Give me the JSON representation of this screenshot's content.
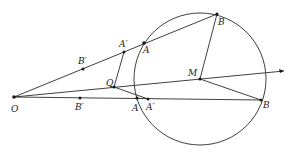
{
  "diagram": {
    "title": "",
    "circle": {
      "center_label": "M",
      "cx": 200,
      "cy": 79,
      "r": 66
    },
    "points": {
      "O": {
        "label": "O",
        "x": 14,
        "y": 97
      },
      "M": {
        "label": "M",
        "x": 200,
        "y": 79
      },
      "Q": {
        "label": "Q",
        "x": 114,
        "y": 87
      },
      "A_upper": {
        "label": "A",
        "x": 144,
        "y": 43
      },
      "A_prime_upper": {
        "label": "A′",
        "x": 124,
        "y": 52
      },
      "B_prime_upper": {
        "label": "B′",
        "x": 83,
        "y": 69
      },
      "B_upper": {
        "label": "B",
        "x": 217,
        "y": 14
      },
      "A_lower": {
        "label": "A",
        "x": 137,
        "y": 98
      },
      "A_prime_lower": {
        "label": "A′",
        "x": 148,
        "y": 99
      },
      "B_prime_lower": {
        "label": "B′",
        "x": 80,
        "y": 98
      },
      "B_lower": {
        "label": "B",
        "x": 261,
        "y": 100
      }
    },
    "ray_end": {
      "x": 284,
      "y": 71
    }
  }
}
